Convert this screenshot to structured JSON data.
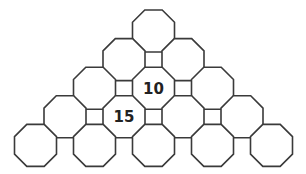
{
  "diagram": {
    "type": "octagon-pyramid-puzzle",
    "rows": 5,
    "cells": [
      {
        "row": 0,
        "col": 0,
        "value": ""
      },
      {
        "row": 1,
        "col": 0,
        "value": ""
      },
      {
        "row": 1,
        "col": 1,
        "value": ""
      },
      {
        "row": 2,
        "col": 0,
        "value": ""
      },
      {
        "row": 2,
        "col": 1,
        "value": "10"
      },
      {
        "row": 2,
        "col": 2,
        "value": ""
      },
      {
        "row": 3,
        "col": 0,
        "value": ""
      },
      {
        "row": 3,
        "col": 1,
        "value": "15"
      },
      {
        "row": 3,
        "col": 2,
        "value": ""
      },
      {
        "row": 3,
        "col": 3,
        "value": ""
      },
      {
        "row": 4,
        "col": 0,
        "value": ""
      },
      {
        "row": 4,
        "col": 1,
        "value": ""
      },
      {
        "row": 4,
        "col": 2,
        "value": ""
      },
      {
        "row": 4,
        "col": 3,
        "value": ""
      },
      {
        "row": 4,
        "col": 4,
        "value": ""
      }
    ],
    "colors": {
      "stroke": "#3a3a3a",
      "fill": "#ffffff",
      "text": "#222222"
    }
  }
}
